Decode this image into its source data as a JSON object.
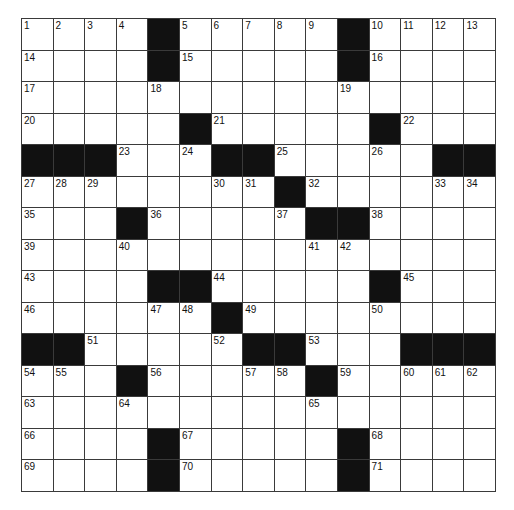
{
  "puzzle": {
    "rows": 15,
    "cols": 15,
    "colors": {
      "block": "#111111",
      "cell": "#ffffff",
      "border": "#3a3a3a",
      "number": "#111111"
    },
    "grid": [
      [
        "1",
        "2",
        "3",
        "4",
        "#",
        "5",
        "6",
        "7",
        "8",
        "9",
        "#",
        "10",
        "11",
        "12",
        "13"
      ],
      [
        "14",
        "",
        "",
        "",
        "#",
        "15",
        "",
        "",
        "",
        "",
        "#",
        "16",
        "",
        "",
        ""
      ],
      [
        "17",
        "",
        "",
        "",
        "18",
        "",
        "",
        "",
        "",
        "",
        "19",
        "",
        "",
        "",
        ""
      ],
      [
        "20",
        "",
        "",
        "",
        "",
        "#",
        "21",
        "",
        "",
        "",
        "",
        "#",
        "22",
        "",
        ""
      ],
      [
        "#",
        "#",
        "#",
        "23",
        "",
        "24",
        "#",
        "#",
        "25",
        "",
        "",
        "26",
        "",
        "#",
        "#"
      ],
      [
        "27",
        "28",
        "29",
        "",
        "",
        "",
        "30",
        "31",
        "#",
        "32",
        "",
        "",
        "",
        "33",
        "34"
      ],
      [
        "35",
        "",
        "",
        "#",
        "36",
        "",
        "",
        "",
        "37",
        "#",
        "#",
        "38",
        "",
        "",
        ""
      ],
      [
        "39",
        "",
        "",
        "40",
        "",
        "",
        "",
        "",
        "",
        "41",
        "42",
        "",
        "",
        "",
        ""
      ],
      [
        "43",
        "",
        "",
        "",
        "#",
        "#",
        "44",
        "",
        "",
        "",
        "",
        "#",
        "45",
        "",
        ""
      ],
      [
        "46",
        "",
        "",
        "",
        "47",
        "48",
        "#",
        "49",
        "",
        "",
        "",
        "50",
        "",
        "",
        ""
      ],
      [
        "#",
        "#",
        "51",
        "",
        "",
        "",
        "52",
        "#",
        "#",
        "53",
        "",
        "",
        "#",
        "#",
        "#"
      ],
      [
        "54",
        "55",
        "",
        "#",
        "56",
        "",
        "",
        "57",
        "58",
        "#",
        "59",
        "",
        "60",
        "61",
        "62"
      ],
      [
        "63",
        "",
        "",
        "64",
        "",
        "",
        "",
        "",
        "",
        "65",
        "",
        "",
        "",
        "",
        ""
      ],
      [
        "66",
        "",
        "",
        "",
        "#",
        "67",
        "",
        "",
        "",
        "",
        "#",
        "68",
        "",
        "",
        ""
      ],
      [
        "69",
        "",
        "",
        "",
        "#",
        "70",
        "",
        "",
        "",
        "",
        "#",
        "71",
        "",
        "",
        ""
      ]
    ]
  }
}
